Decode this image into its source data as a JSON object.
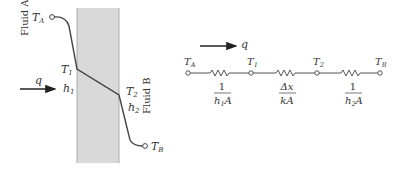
{
  "wall_diagram": {
    "fluid_a_label": "Fluid A",
    "fluid_b_label": "Fluid B",
    "heat_flow_label": "q",
    "nodes": {
      "ta": {
        "main": "T",
        "sub": "A"
      },
      "t1": {
        "main": "T",
        "sub": "1"
      },
      "t2": {
        "main": "T",
        "sub": "2"
      },
      "tb": {
        "main": "T",
        "sub": "B"
      }
    },
    "h1": {
      "main": "h",
      "sub": "1"
    },
    "h2": {
      "main": "h",
      "sub": "2"
    },
    "wall_color": "#d9d9d9",
    "line_color": "#444444"
  },
  "circuit": {
    "heat_flow_label": "q",
    "nodes": [
      {
        "main": "T",
        "sub": "A"
      },
      {
        "main": "T",
        "sub": "1"
      },
      {
        "main": "T",
        "sub": "2"
      },
      {
        "main": "T",
        "sub": "B"
      }
    ],
    "resistances": [
      {
        "numerator": "1",
        "denominator_main": "h",
        "denominator_sub": "1",
        "denominator_tail": "A"
      },
      {
        "numerator": "Δx",
        "denominator_main": "kA",
        "denominator_sub": "",
        "denominator_tail": ""
      },
      {
        "numerator": "1",
        "denominator_main": "h",
        "denominator_sub": "2",
        "denominator_tail": "A"
      }
    ]
  }
}
